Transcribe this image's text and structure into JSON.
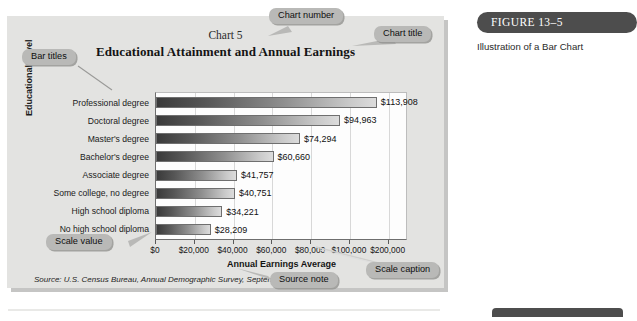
{
  "figure": {
    "pill_label": "FIGURE 13–5",
    "caption": "Illustration of a Bar Chart"
  },
  "chart_block": {
    "chart_number": "Chart 5",
    "chart_title": "Educational Attainment and Annual Earnings",
    "source_note": "Source: U.S. Census Bureau, Annual Demographic Survey, September 2002."
  },
  "callouts": [
    {
      "id": "bar-titles",
      "label": "Bar titles"
    },
    {
      "id": "chart-number",
      "label": "Chart number"
    },
    {
      "id": "chart-title",
      "label": "Chart title"
    },
    {
      "id": "scale-value",
      "label": "Scale value"
    },
    {
      "id": "scale-caption",
      "label": "Scale caption"
    },
    {
      "id": "source-note",
      "label": "Source note"
    }
  ],
  "chart_data": {
    "type": "bar",
    "orientation": "horizontal",
    "title": "Educational Attainment and Annual Earnings",
    "subtitle": "Chart 5",
    "xlabel": "Annual Earnings Average",
    "ylabel": "Educational Level",
    "categories": [
      "Professional degree",
      "Doctoral degree",
      "Master's degree",
      "Bachelor's degree",
      "Associate degree",
      "Some college, no degree",
      "High school diploma",
      "No high school diploma"
    ],
    "values": [
      113908,
      94963,
      74294,
      60660,
      41757,
      40751,
      34221,
      28209
    ],
    "value_labels": [
      "$113,908",
      "$94,963",
      "$74,294",
      "$60,660",
      "$41,757",
      "$40,751",
      "$34,221",
      "$28,209"
    ],
    "tick_labels": [
      "$0",
      "$20,000",
      "$40,000",
      "$60,000",
      "$80,000",
      "$100,000",
      "$200,000"
    ],
    "tick_values": [
      0,
      20000,
      40000,
      60000,
      80000,
      100000,
      120000
    ],
    "xlim": [
      0,
      130000
    ],
    "grid": "vertical",
    "legend": "none",
    "source": "Source: U.S. Census Bureau, Annual Demographic Survey, September 2002."
  },
  "colors": {
    "panel_background": "#e3e3e1",
    "plot_background": "#fdfdfd",
    "bar_dark": "#3a3a3a",
    "bar_light": "#dcdcdc",
    "callout_fill": "#b9b9b7",
    "figure_pill": "#4d4d4d"
  }
}
